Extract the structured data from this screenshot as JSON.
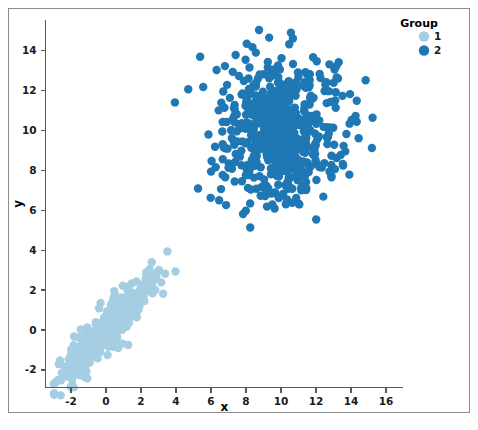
{
  "figure": {
    "background": "#ffffff",
    "frame_color": "#8d8d8d",
    "width": 478,
    "height": 430
  },
  "legend": {
    "title": "Group",
    "position": "top-right",
    "items": [
      {
        "label": "1",
        "color": "#a6cee3"
      },
      {
        "label": "2",
        "color": "#1f78b4"
      }
    ]
  },
  "axes": {
    "x_title": "x",
    "y_title": "y",
    "x_ticks": [
      "-2",
      "0",
      "2",
      "4",
      "6",
      "8",
      "10",
      "12",
      "14",
      "16"
    ],
    "y_ticks": [
      "-2",
      "0",
      "2",
      "4",
      "6",
      "8",
      "10",
      "12",
      "14"
    ]
  },
  "chart_data": {
    "type": "scatter",
    "title": "",
    "xlabel": "x",
    "ylabel": "y",
    "xlim": [
      -3.4,
      17.8
    ],
    "ylim": [
      -3.6,
      15.4
    ],
    "grid": false,
    "legend_title": "Group",
    "legend_position": "top-right",
    "x_ticks": [
      -2,
      0,
      2,
      4,
      6,
      8,
      10,
      12,
      14,
      16
    ],
    "y_ticks": [
      -2,
      0,
      2,
      4,
      6,
      8,
      10,
      12,
      14
    ],
    "marker_size": 4.2,
    "series": [
      {
        "name": "1",
        "color": "#a6cee3",
        "n": 400,
        "description": "Tight positively-correlated elongated cluster near the origin",
        "center": [
          0.0,
          0.0
        ],
        "sd": [
          1.35,
          1.35
        ],
        "correlation": 0.92,
        "x_range": [
          -2.9,
          3.2
        ],
        "y_range": [
          -3.2,
          3.1
        ]
      },
      {
        "name": "2",
        "color": "#1f78b4",
        "n": 620,
        "description": "Broad round cloud centered near (10, 10)",
        "center": [
          10.0,
          10.0
        ],
        "sd": [
          1.75,
          1.8
        ],
        "correlation": 0.02,
        "x_range": [
          3.6,
          17.1
        ],
        "y_range": [
          3.6,
          15.1
        ]
      }
    ]
  }
}
